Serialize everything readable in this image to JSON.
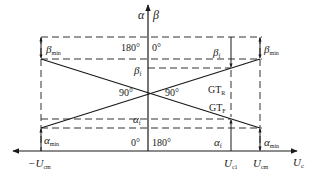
{
  "axes": {
    "vertical_label_left": "α",
    "vertical_label_right": "β",
    "horizontal_label": "U",
    "horizontal_label_sub": "c"
  },
  "angles": {
    "top_left": "180°",
    "top_right": "0°",
    "bottom_left": "0°",
    "bottom_right": "180°",
    "cross_left": "90°",
    "cross_right": "90°"
  },
  "labels": {
    "beta_min_left": {
      "main": "β",
      "sub": "min"
    },
    "beta_min_right": {
      "main": "β",
      "sub": "min"
    },
    "beta_f_center": {
      "main": "β",
      "sub": "f"
    },
    "beta_f_right": {
      "main": "β",
      "sub": "f"
    },
    "alpha_f_center": {
      "main": "α",
      "sub": "f"
    },
    "alpha_f_right": {
      "main": "α",
      "sub": "f"
    },
    "alpha_min_left": {
      "main": "α",
      "sub": "min"
    },
    "alpha_min_right": {
      "main": "α",
      "sub": "min"
    },
    "gt_r": {
      "main": "GT",
      "sub": "R"
    },
    "gt_f": {
      "main": "GT",
      "sub": "F"
    }
  },
  "x_ticks": {
    "neg_ucm": {
      "prefix": "−U",
      "sub": "cm"
    },
    "uc1": {
      "prefix": "U",
      "sub": "c1"
    },
    "ucm": {
      "prefix": "U",
      "sub": "cm"
    }
  },
  "colors": {
    "line": "#1a1a1a",
    "dash": "#333333",
    "background": "#ffffff"
  }
}
